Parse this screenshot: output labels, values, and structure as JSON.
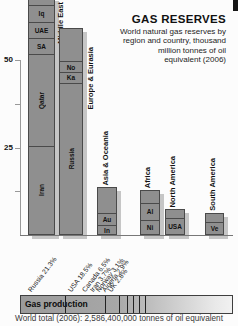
{
  "header": {
    "title": "GAS RESERVES",
    "subtitle_lines": [
      "World natural gas reserves by",
      "region and country, thousand",
      "million tonnes of oil",
      "equivalent (2006)"
    ]
  },
  "colors": {
    "bar_fill": "#8f8f8f",
    "bar_border": "#4a4a4a",
    "shadow": "#c6c6c6",
    "axis": "#999999",
    "baseline": "#777777",
    "divider": "#222222",
    "production_gradient_start": "#9b9b9b",
    "production_gradient_end": "#f1f1f1"
  },
  "chart_data": {
    "type": "bar",
    "stacked": true,
    "title": "GAS RESERVES",
    "subtitle": "World natural gas reserves by region and country, thousand million tonnes of oil equivalent (2006)",
    "unit": "thousand million tonnes of oil equivalent",
    "year": 2006,
    "grid": false,
    "ylim": [
      0,
      68
    ],
    "yticks": [
      {
        "value": 50,
        "label": "50"
      },
      {
        "value": 37.5,
        "label": ""
      },
      {
        "value": 25,
        "label": "25"
      },
      {
        "value": 12.5,
        "label": ""
      }
    ],
    "bars": [
      {
        "region": "Middle East",
        "clipped_top": true,
        "segments": [
          {
            "label": "Iran",
            "value": 25.5
          },
          {
            "label": "Qatar",
            "value": 26.5
          },
          {
            "label": "SA",
            "value": 4.6
          },
          {
            "label": "UAE",
            "value": 4.6
          },
          {
            "label": "Iq",
            "value": 4.9
          },
          {
            "label": "",
            "value": 2
          }
        ]
      },
      {
        "region": "Europe & Eurasia",
        "clipped_top": false,
        "segments": [
          {
            "label": "Russia",
            "value": 43.7
          },
          {
            "label": "Ka",
            "value": 2.9
          },
          {
            "label": "No",
            "value": 3.4
          },
          {
            "label": "",
            "value": 9.1
          }
        ]
      },
      {
        "region": "Asia & Oceania",
        "clipped_top": false,
        "segments": [
          {
            "label": "In",
            "value": 2.6
          },
          {
            "label": "Au",
            "value": 3.7
          },
          {
            "label": "",
            "value": 7.4
          }
        ]
      },
      {
        "region": "Africa",
        "clipped_top": false,
        "segments": [
          {
            "label": "Ni",
            "value": 4.3
          },
          {
            "label": "Al",
            "value": 4.9
          },
          {
            "label": "",
            "value": 3.7
          }
        ]
      },
      {
        "region": "North America",
        "clipped_top": false,
        "segments": [
          {
            "label": "USA",
            "value": 4.9
          },
          {
            "label": "",
            "value": 2.6
          }
        ]
      },
      {
        "region": "South America",
        "clipped_top": false,
        "segments": [
          {
            "label": "Ve",
            "value": 3.7
          },
          {
            "label": "",
            "value": 2.6
          }
        ]
      }
    ],
    "production": {
      "label": "Gas production",
      "total_label": "World total (2006): 2,586,400,000 tonnes of oil equivalent",
      "segments": [
        {
          "name": "Russia",
          "pct": 21.3
        },
        {
          "name": "USA",
          "pct": 18.5
        },
        {
          "name": "Canada",
          "pct": 6.5
        },
        {
          "name": "Iran",
          "pct": 3.7
        },
        {
          "name": "Norway",
          "pct": 3.1
        },
        {
          "name": "Algeria",
          "pct": 2.9
        },
        {
          "name": "UK",
          "pct": 2.8
        }
      ]
    }
  }
}
